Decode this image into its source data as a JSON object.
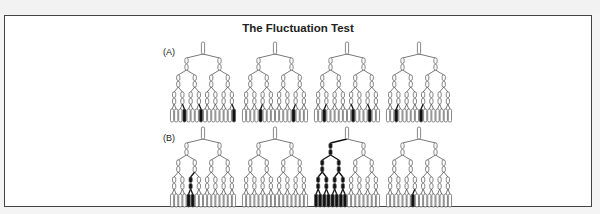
{
  "figure": {
    "title": "The Fluctuation Test",
    "rows": [
      {
        "label": "(A)",
        "description": "Induced-mutation hypothesis: resistant cells arise randomly at the final generation only",
        "trees": [
          {
            "filled_leaves": [
              4,
              8,
              16
            ],
            "filled_branches": []
          },
          {
            "filled_leaves": [
              5,
              13
            ],
            "filled_branches": []
          },
          {
            "filled_leaves": [
              3,
              10,
              14
            ],
            "filled_branches": []
          },
          {
            "filled_leaves": [
              3,
              9
            ],
            "filled_branches": []
          }
        ]
      },
      {
        "label": "(B)",
        "description": "Spontaneous-mutation hypothesis: mutations arise at different generations, producing clonal jackpots",
        "trees": [
          {
            "filled_leaves": [
              5,
              6
            ],
            "filled_branches": [
              "L3-3"
            ]
          },
          {
            "filled_leaves": [],
            "filled_branches": []
          },
          {
            "filled_leaves": [
              1,
              2,
              3,
              4,
              5,
              6,
              7,
              8
            ],
            "filled_branches": [
              "L1-1",
              "L2-1",
              "L2-2",
              "L3-1",
              "L3-2",
              "L3-3",
              "L3-4"
            ]
          },
          {
            "filled_leaves": [
              7
            ],
            "filled_branches": []
          }
        ]
      }
    ],
    "tree_structure": {
      "levels": 5,
      "leaves_per_tree": 16
    },
    "colors": {
      "frame_border": "#444444",
      "cell_outline": "#555555",
      "cell_empty": "#ffffff",
      "cell_filled": "#111111",
      "background": "#ffffff"
    }
  }
}
